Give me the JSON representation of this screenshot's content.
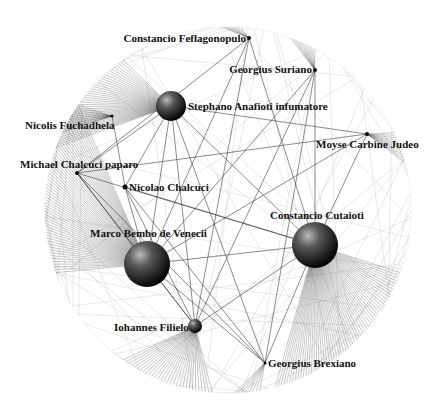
{
  "diagram": {
    "type": "network-graph",
    "layout": "circular-boundary",
    "boundary": {
      "cx": 228,
      "cy": 210,
      "r": 183
    },
    "colors": {
      "background": "#ffffff",
      "edge": "#333333",
      "edge_faint": "#bbbbbb",
      "label": "#111111",
      "node_light": "#9a9a9a",
      "node_dark": "#050505"
    },
    "nodes": [
      {
        "id": "feflagonopulo",
        "label": "Constancio Feflagonopulo",
        "x": 249,
        "y": 38,
        "r": 2,
        "label_x": 246,
        "label_y": 42,
        "anchor": "end"
      },
      {
        "id": "suriano",
        "label": "Georgius Suriano",
        "x": 315,
        "y": 70,
        "r": 2,
        "label_x": 312,
        "label_y": 73,
        "anchor": "end"
      },
      {
        "id": "anafioti",
        "label": "Stephano Anafioti infumatore",
        "x": 171,
        "y": 106,
        "r": 15,
        "label_x": 188,
        "label_y": 110,
        "anchor": "start"
      },
      {
        "id": "fuchadhela",
        "label": "Nicolis Fuchadhela",
        "x": 112,
        "y": 116,
        "r": 1.5,
        "label_x": 25,
        "label_y": 129,
        "anchor": "start"
      },
      {
        "id": "carbine",
        "label": "Moyse Carbine Judeo",
        "x": 367,
        "y": 134,
        "r": 2,
        "label_x": 316,
        "label_y": 148,
        "anchor": "start"
      },
      {
        "id": "chalcuci_paparo",
        "label": "Michael Chalcuci paparo",
        "x": 77,
        "y": 173,
        "r": 2,
        "label_x": 20,
        "label_y": 168,
        "anchor": "start"
      },
      {
        "id": "nicolao",
        "label": "Nicolao Chalcuci",
        "x": 125,
        "y": 187,
        "r": 2.5,
        "label_x": 129,
        "label_y": 191,
        "anchor": "start"
      },
      {
        "id": "cutaioti",
        "label": "Constancio Cutaioti",
        "x": 315,
        "y": 245,
        "r": 23,
        "label_x": 270,
        "label_y": 219,
        "anchor": "start"
      },
      {
        "id": "bembo",
        "label": "Marco Bembo de Venecii",
        "x": 147,
        "y": 264,
        "r": 23,
        "label_x": 90,
        "label_y": 237,
        "anchor": "start"
      },
      {
        "id": "filielo",
        "label": "Iohannes Filielo",
        "x": 195,
        "y": 326,
        "r": 7,
        "label_x": 114,
        "label_y": 331,
        "anchor": "start"
      },
      {
        "id": "brexiano",
        "label": "Georgius Brexiano",
        "x": 265,
        "y": 363,
        "r": 1.5,
        "label_x": 268,
        "label_y": 367,
        "anchor": "start"
      }
    ],
    "fans": [
      {
        "from": "anafioti",
        "arc_start": 200,
        "arc_end": 235,
        "count": 40
      },
      {
        "from": "bembo",
        "arc_start": 160,
        "arc_end": 215,
        "count": 60
      },
      {
        "from": "cutaioti",
        "arc_start": 20,
        "arc_end": 75,
        "count": 60
      },
      {
        "from": "filielo",
        "arc_start": 95,
        "arc_end": 125,
        "count": 30
      },
      {
        "from": "fuchadhela",
        "arc_start": 205,
        "arc_end": 215,
        "count": 12
      },
      {
        "from": "carbine",
        "arc_start": 335,
        "arc_end": 345,
        "count": 12
      },
      {
        "from": "suriano",
        "arc_start": 290,
        "arc_end": 298,
        "count": 10
      },
      {
        "from": "feflagonopulo",
        "arc_start": 268,
        "arc_end": 274,
        "count": 8
      },
      {
        "from": "brexiano",
        "arc_start": 80,
        "arc_end": 88,
        "count": 8
      }
    ],
    "edges": [
      [
        "anafioti",
        "bembo"
      ],
      [
        "anafioti",
        "cutaioti"
      ],
      [
        "anafioti",
        "nicolao"
      ],
      [
        "anafioti",
        "filielo"
      ],
      [
        "anafioti",
        "brexiano"
      ],
      [
        "anafioti",
        "chalcuci_paparo"
      ],
      [
        "anafioti",
        "carbine"
      ],
      [
        "bembo",
        "cutaioti"
      ],
      [
        "bembo",
        "filielo"
      ],
      [
        "bembo",
        "brexiano"
      ],
      [
        "bembo",
        "nicolao"
      ],
      [
        "bembo",
        "suriano"
      ],
      [
        "bembo",
        "feflagonopulo"
      ],
      [
        "bembo",
        "chalcuci_paparo"
      ],
      [
        "cutaioti",
        "nicolao"
      ],
      [
        "cutaioti",
        "suriano"
      ],
      [
        "cutaioti",
        "feflagonopulo"
      ],
      [
        "cutaioti",
        "filielo"
      ],
      [
        "cutaioti",
        "chalcuci_paparo"
      ],
      [
        "cutaioti",
        "carbine"
      ],
      [
        "cutaioti",
        "brexiano"
      ],
      [
        "nicolao",
        "fuchadhela"
      ],
      [
        "nicolao",
        "filielo"
      ],
      [
        "nicolao",
        "brexiano"
      ],
      [
        "chalcuci_paparo",
        "filielo"
      ],
      [
        "chalcuci_paparo",
        "brexiano"
      ],
      [
        "feflagonopulo",
        "filielo"
      ],
      [
        "feflagonopulo",
        "chalcuci_paparo"
      ],
      [
        "suriano",
        "filielo"
      ],
      [
        "suriano",
        "brexiano"
      ],
      [
        "carbine",
        "bembo"
      ],
      [
        "carbine",
        "chalcuci_paparo"
      ]
    ]
  }
}
